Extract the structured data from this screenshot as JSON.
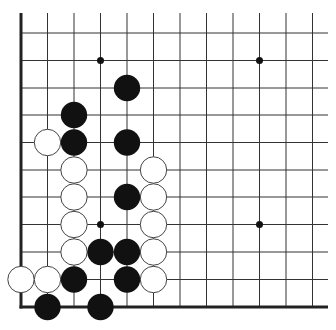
{
  "board": {
    "description": "Go board corner (lower-left), 12 columns x 11 rows visible",
    "colors": {
      "background": "#ffffff",
      "line": "#333333",
      "edge": "#222222",
      "black_stone": "#111111",
      "white_stone": "#ffffff",
      "white_outline": "#444444",
      "star": "#111111"
    },
    "cols_x": [
      21,
      47.5,
      74,
      100.5,
      127,
      153.5,
      180,
      206.5,
      233,
      259.5,
      286,
      312.5
    ],
    "rows_y": [
      33,
      60.5,
      88,
      115,
      142.5,
      170,
      197,
      224.5,
      252,
      279.5,
      307
    ],
    "grid_top": 13,
    "grid_right": 328,
    "stone_radius": 13.2,
    "star_points": [
      [
        3,
        1
      ],
      [
        9,
        1
      ],
      [
        3,
        7
      ],
      [
        9,
        7
      ]
    ],
    "black_stones": [
      [
        4,
        2
      ],
      [
        2,
        3
      ],
      [
        2,
        4
      ],
      [
        4,
        4
      ],
      [
        4,
        6
      ],
      [
        3,
        8
      ],
      [
        4,
        8
      ],
      [
        2,
        9
      ],
      [
        4,
        9
      ],
      [
        1,
        10
      ],
      [
        3,
        10
      ]
    ],
    "white_stones": [
      [
        1,
        4
      ],
      [
        2,
        5
      ],
      [
        5,
        5
      ],
      [
        2,
        6
      ],
      [
        5,
        6
      ],
      [
        2,
        7
      ],
      [
        5,
        7
      ],
      [
        2,
        8
      ],
      [
        5,
        8
      ],
      [
        0,
        9
      ],
      [
        1,
        9
      ],
      [
        5,
        9
      ]
    ]
  }
}
